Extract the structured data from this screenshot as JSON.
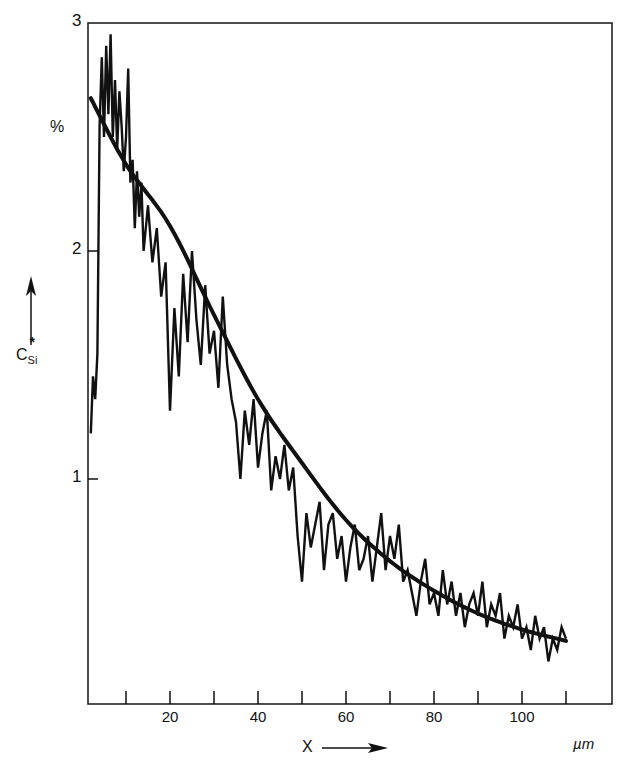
{
  "chart_data": {
    "type": "line",
    "title": "",
    "xlabel": "X",
    "xlabel_unit": "µm",
    "ylabel": "C*Si",
    "ylabel_unit": "%",
    "xlim": [
      1.4,
      120
    ],
    "ylim": [
      0,
      3
    ],
    "grid": false,
    "legend": null,
    "x_ticks": [
      10,
      20,
      30,
      40,
      50,
      60,
      70,
      80,
      90,
      100,
      110
    ],
    "x_tick_labels": [
      "",
      "20",
      "",
      "40",
      "",
      "60",
      "",
      "80",
      "",
      "100",
      ""
    ],
    "y_ticks": [
      1,
      2,
      3
    ],
    "y_tick_labels": [
      "1",
      "2",
      "3"
    ],
    "series": [
      {
        "name": "measured",
        "style": "noisy-trace",
        "x": [
          2.0,
          2.5,
          3.0,
          3.5,
          4.0,
          4.5,
          5.0,
          5.5,
          6.0,
          6.5,
          7.0,
          7.5,
          8.0,
          8.5,
          9.0,
          9.5,
          10.0,
          10.5,
          11.0,
          11.5,
          12.0,
          12.5,
          13.0,
          13.5,
          14.0,
          15.0,
          16.0,
          17.0,
          18.0,
          19.0,
          20.0,
          21.0,
          22.0,
          23.0,
          24.0,
          25.0,
          26.0,
          27.0,
          28.0,
          29.0,
          30.0,
          31.0,
          32.0,
          33.0,
          34.0,
          35.0,
          36.0,
          37.0,
          38.0,
          39.0,
          40.0,
          41.0,
          42.0,
          43.0,
          44.0,
          45.0,
          46.0,
          47.0,
          48.0,
          49.0,
          50.0,
          51.0,
          52.0,
          53.0,
          54.0,
          55.0,
          56.0,
          57.0,
          58.0,
          59.0,
          60.0,
          61.0,
          62.0,
          63.0,
          64.0,
          65.0,
          66.0,
          67.0,
          68.0,
          69.0,
          70.0,
          71.0,
          72.0,
          73.0,
          74.0,
          75.0,
          76.0,
          77.0,
          78.0,
          79.0,
          80.0,
          81.0,
          82.0,
          83.0,
          84.0,
          85.0,
          86.0,
          87.0,
          88.0,
          89.0,
          90.0,
          91.0,
          92.0,
          93.0,
          94.0,
          95.0,
          96.0,
          97.0,
          98.0,
          99.0,
          100.0,
          101.0,
          102.0,
          103.0,
          104.0,
          105.0,
          106.0,
          107.0,
          108.0,
          109.0,
          110.0
        ],
        "y": [
          1.2,
          1.45,
          1.35,
          1.55,
          2.55,
          2.85,
          2.5,
          2.9,
          2.6,
          2.95,
          2.5,
          2.75,
          2.45,
          2.7,
          2.55,
          2.35,
          2.5,
          2.8,
          2.3,
          2.4,
          2.1,
          2.35,
          2.15,
          2.3,
          2.0,
          2.2,
          1.95,
          2.1,
          1.8,
          1.95,
          1.3,
          1.75,
          1.45,
          1.9,
          1.6,
          2.0,
          1.7,
          1.5,
          1.85,
          1.55,
          1.65,
          1.4,
          1.8,
          1.5,
          1.35,
          1.25,
          1.0,
          1.3,
          1.15,
          1.35,
          1.05,
          1.2,
          1.3,
          0.95,
          1.1,
          1.0,
          1.15,
          0.95,
          1.05,
          0.75,
          0.55,
          0.85,
          0.7,
          0.8,
          0.9,
          0.6,
          0.8,
          0.85,
          0.65,
          0.75,
          0.55,
          0.7,
          0.8,
          0.6,
          0.65,
          0.75,
          0.55,
          0.7,
          0.85,
          0.6,
          0.75,
          0.65,
          0.8,
          0.55,
          0.6,
          0.5,
          0.4,
          0.55,
          0.65,
          0.45,
          0.5,
          0.4,
          0.6,
          0.45,
          0.55,
          0.4,
          0.5,
          0.35,
          0.45,
          0.5,
          0.4,
          0.55,
          0.35,
          0.45,
          0.4,
          0.5,
          0.3,
          0.4,
          0.35,
          0.45,
          0.3,
          0.35,
          0.25,
          0.4,
          0.3,
          0.35,
          0.2,
          0.3,
          0.25,
          0.35,
          0.3
        ]
      },
      {
        "name": "fit",
        "style": "smooth-curve",
        "x": [
          2,
          10,
          20,
          30,
          40,
          50,
          60,
          70,
          80,
          90,
          100,
          110
        ],
        "y": [
          2.67,
          2.38,
          2.11,
          1.72,
          1.35,
          1.07,
          0.82,
          0.64,
          0.51,
          0.41,
          0.34,
          0.29
        ]
      }
    ]
  },
  "labels": {
    "y_unit": "%",
    "y_axis_symbol": "C",
    "y_axis_sup": "*",
    "y_axis_sub": "Si",
    "x_axis_symbol": "X",
    "x_unit": "µm"
  },
  "colors": {
    "ink": "#111111",
    "background": "#ffffff"
  }
}
